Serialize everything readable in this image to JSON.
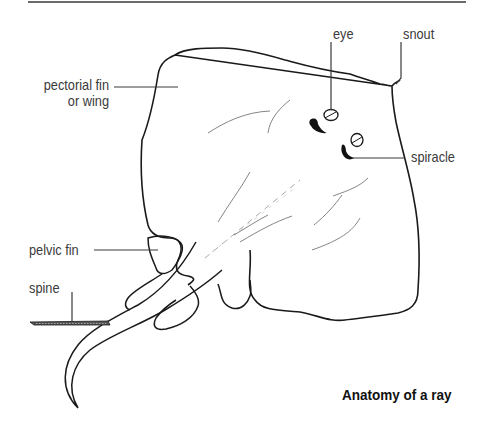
{
  "figure": {
    "title": "Anatomy of a ray",
    "subject": "ray",
    "labels": [
      {
        "id": "pectoral",
        "lines": [
          "pectorial fin",
          "or wing"
        ]
      },
      {
        "id": "eye",
        "text": "eye"
      },
      {
        "id": "snout",
        "text": "snout"
      },
      {
        "id": "spiracle",
        "text": "spiracle"
      },
      {
        "id": "pelvic",
        "text": "pelvic fin"
      },
      {
        "id": "spine",
        "text": "spine"
      }
    ]
  },
  "colors": {
    "line": "#1a1a1a",
    "text": "#3a3a3a",
    "background": "#ffffff"
  }
}
